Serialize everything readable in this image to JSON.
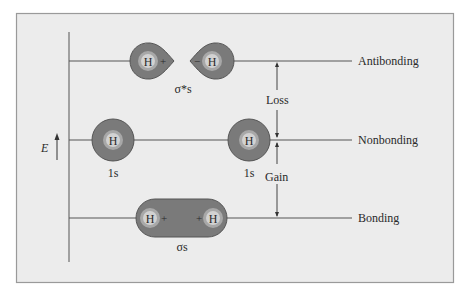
{
  "diagram": {
    "axis": {
      "label": "E",
      "arrow": "up"
    },
    "levels": [
      {
        "id": "antibonding",
        "label": "Antibonding",
        "orbital_label": "σ*s"
      },
      {
        "id": "nonbonding",
        "label": "Nonbonding",
        "orbital_label": "1s"
      },
      {
        "id": "bonding",
        "label": "Bonding",
        "orbital_label": "σs"
      }
    ],
    "antibonding": {
      "left_atom": "H",
      "left_sign": "+",
      "right_atom": "H",
      "right_sign": "−",
      "label": "σ*s"
    },
    "nonbonding": {
      "left_atom": "H",
      "left_label": "1s",
      "right_atom": "H",
      "right_label": "1s"
    },
    "bonding": {
      "left_atom": "H",
      "left_sign": "+",
      "right_atom": "H",
      "right_sign": "+",
      "label": "σs"
    },
    "energy_changes": {
      "loss": "Loss",
      "gain": "Gain"
    },
    "colors": {
      "background": "#ffffff",
      "panel": "#ececec",
      "frame": "#9a9a9a",
      "line": "#555555",
      "orbital_fill": "#7a7a7a",
      "orbital_stroke": "#555555",
      "nucleus_outer": "#a8a8a8",
      "nucleus_inner": "#d2d2d2",
      "text": "#2a2a2a"
    }
  }
}
